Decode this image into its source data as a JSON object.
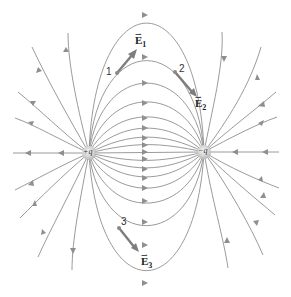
{
  "diagram": {
    "type": "field-line diagram",
    "colors": {
      "field_line": "#8f8f8f",
      "vector": "#7d7d7d",
      "charge": "#c8c8c8"
    },
    "charges": [
      {
        "id": "positive",
        "label": "+q",
        "x": 89,
        "y": 153
      },
      {
        "id": "negative",
        "label": "−q",
        "x": 204,
        "y": 152
      }
    ],
    "points": [
      {
        "id": "1",
        "label": "1",
        "x": 117,
        "y": 73
      },
      {
        "id": "2",
        "label": "2",
        "x": 175,
        "y": 72
      },
      {
        "id": "3",
        "label": "3",
        "x": 119,
        "y": 228
      }
    ],
    "vectors": [
      {
        "id": "E1",
        "symbol": "E",
        "subscript": "1",
        "from": [
          117,
          73
        ],
        "to": [
          136,
          50
        ]
      },
      {
        "id": "E2",
        "symbol": "E",
        "subscript": "2",
        "from": [
          175,
          72
        ],
        "to": [
          197,
          97
        ]
      },
      {
        "id": "E3",
        "symbol": "E",
        "subscript": "3",
        "from": [
          119,
          228
        ],
        "to": [
          139,
          252
        ]
      }
    ]
  }
}
